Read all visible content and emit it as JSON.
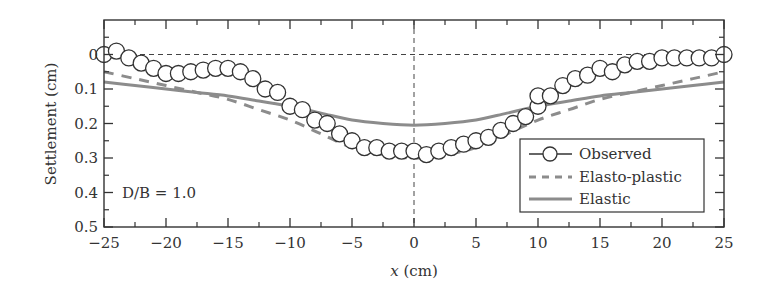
{
  "chart_data": {
    "type": "line",
    "title": "",
    "xlabel": "x (cm)",
    "xlabel_italic_part": "x",
    "xlabel_unit": " (cm)",
    "ylabel": "Settlement (cm)",
    "xlim": [
      -25,
      25
    ],
    "ylim": [
      0.5,
      -0.1
    ],
    "y_inverted": true,
    "x_ticks": [
      -25,
      -20,
      -15,
      -10,
      -5,
      0,
      5,
      10,
      15,
      20,
      25
    ],
    "x_tick_labels": [
      "−25",
      "−20",
      "−15",
      "−10",
      "−5",
      "0",
      "5",
      "10",
      "15",
      "20",
      "25"
    ],
    "x_minor_ticks": [
      -22.5,
      -17.5,
      -12.5,
      -7.5,
      -2.5,
      2.5,
      7.5,
      12.5,
      17.5,
      22.5
    ],
    "y_ticks": [
      0,
      0.1,
      0.2,
      0.3,
      0.4,
      0.5
    ],
    "y_tick_labels": [
      "0",
      "0.1",
      "0.2",
      "0.3",
      "0.4",
      "0.5"
    ],
    "y_minor_ticks": [
      -0.05,
      0.05,
      0.15,
      0.25,
      0.35,
      0.45
    ],
    "grid": false,
    "reference_lines": [
      {
        "orientation": "horizontal",
        "value": 0,
        "style": "dashed"
      },
      {
        "orientation": "vertical",
        "value": 0,
        "style": "dashed"
      }
    ],
    "annotation": "D/B = 1.0",
    "legend": {
      "position": "lower right",
      "entries": [
        "Observed",
        "Elasto-plastic",
        "Elastic"
      ]
    },
    "series": [
      {
        "name": "Observed",
        "style": "open-circle markers",
        "color": "#333333",
        "x": [
          -25,
          -24,
          -23,
          -22,
          -21,
          -20,
          -19,
          -18,
          -17,
          -16,
          -15,
          -14,
          -13,
          -12,
          -11,
          -10,
          -9,
          -8,
          -7,
          -6,
          -5,
          -4,
          -3,
          -2,
          -1,
          0,
          1,
          2,
          3,
          4,
          5,
          6,
          7,
          8,
          9,
          10,
          10,
          11,
          12,
          13,
          14,
          15,
          16,
          17,
          18,
          19,
          20,
          21,
          22,
          23,
          24,
          25
        ],
        "y": [
          0.0,
          -0.01,
          0.01,
          0.025,
          0.04,
          0.055,
          0.055,
          0.05,
          0.045,
          0.04,
          0.04,
          0.05,
          0.07,
          0.1,
          0.11,
          0.15,
          0.16,
          0.19,
          0.2,
          0.23,
          0.25,
          0.27,
          0.27,
          0.28,
          0.28,
          0.28,
          0.29,
          0.28,
          0.27,
          0.26,
          0.25,
          0.24,
          0.22,
          0.2,
          0.18,
          0.15,
          0.12,
          0.12,
          0.09,
          0.07,
          0.06,
          0.04,
          0.05,
          0.03,
          0.02,
          0.02,
          0.01,
          0.01,
          0.01,
          0.01,
          0.01,
          0.0
        ]
      },
      {
        "name": "Elasto-plastic",
        "style": "dashed line",
        "color": "#8c8c8c",
        "x": [
          -25,
          -22.5,
          -20,
          -17.5,
          -15,
          -12.5,
          -10,
          -7.5,
          -5,
          -2.5,
          0,
          2.5,
          5,
          7.5,
          10,
          12.5,
          15,
          17.5,
          20,
          22.5,
          25
        ],
        "y": [
          0.05,
          0.07,
          0.09,
          0.11,
          0.13,
          0.16,
          0.19,
          0.23,
          0.27,
          0.29,
          0.3,
          0.29,
          0.27,
          0.23,
          0.19,
          0.16,
          0.13,
          0.11,
          0.09,
          0.07,
          0.05
        ]
      },
      {
        "name": "Elastic",
        "style": "solid line",
        "color": "#8c8c8c",
        "x": [
          -25,
          -22.5,
          -20,
          -17.5,
          -15,
          -12.5,
          -10,
          -7.5,
          -5,
          -2.5,
          0,
          2.5,
          5,
          7.5,
          10,
          12.5,
          15,
          17.5,
          20,
          22.5,
          25
        ],
        "y": [
          0.08,
          0.09,
          0.1,
          0.11,
          0.12,
          0.135,
          0.15,
          0.17,
          0.19,
          0.2,
          0.205,
          0.2,
          0.19,
          0.17,
          0.15,
          0.135,
          0.12,
          0.11,
          0.1,
          0.09,
          0.08
        ]
      }
    ]
  },
  "colors": {
    "axis": "#333333",
    "observed": "#333333",
    "model_lines": "#8c8c8c",
    "background": "#ffffff"
  }
}
